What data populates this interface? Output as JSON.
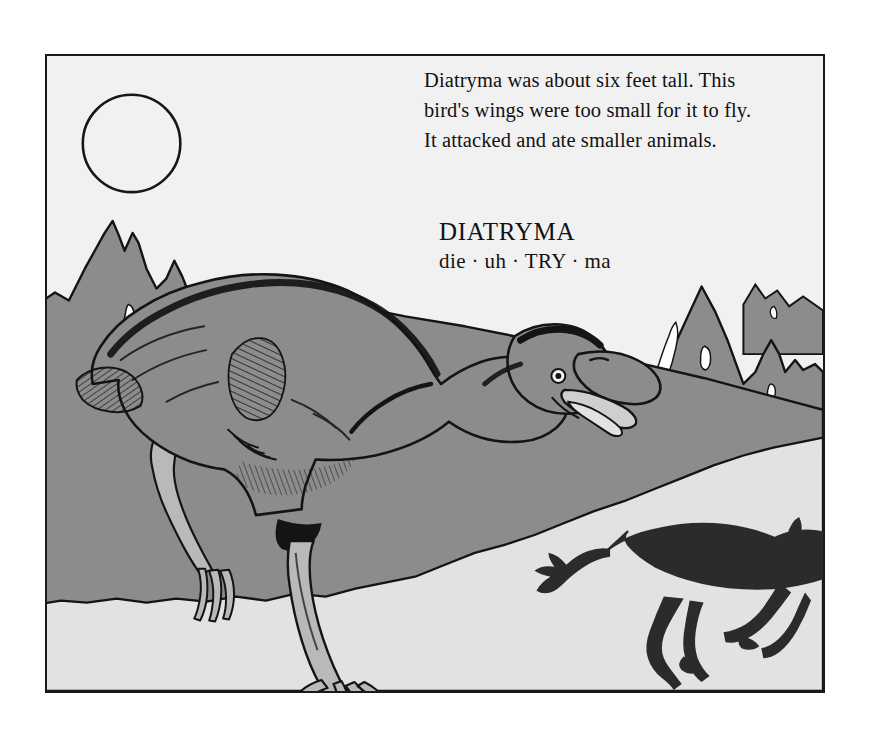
{
  "page": {
    "background_color": "#ffffff",
    "width": 879,
    "height": 745
  },
  "frame": {
    "border_color": "#1a1a1a",
    "left": 45,
    "top": 54,
    "width": 780,
    "height": 639
  },
  "caption": {
    "text": "Diatryma was about six feet tall. This\nbird's wings were too small for it to fly.\nIt attacked and ate smaller animals."
  },
  "label": {
    "species_name": "DIATRYMA",
    "pronunciation": "die · uh · TRY · ma"
  },
  "scene": {
    "sky_color": "#f1f1f1",
    "hill_color": "#8c8c8c",
    "foreground_color": "#e2e2e2",
    "ink_color": "#141414",
    "bird_body_color": "#8c8c8c",
    "bird_leg_color": "#b9b9b9",
    "mammal_color": "#2b2b2b",
    "snow_color": "#ffffff",
    "sun_outline_color": "#161616",
    "elements": [
      "sun-circle",
      "left-mountain",
      "right-mountain",
      "far-mountain",
      "hill-slope",
      "foreground-ground",
      "diatryma-bird",
      "running-mammal"
    ]
  }
}
